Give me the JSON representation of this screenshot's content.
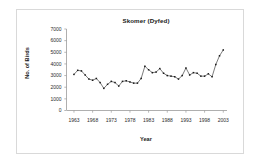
{
  "figure": {
    "background": "#ffffff",
    "border_color": "#d9d9d9"
  },
  "chart_data": {
    "type": "line",
    "title": "Skomer (Dyfed)",
    "xlabel": "Year",
    "ylabel": "No. of Birds",
    "grid": false,
    "legend": "none",
    "marker": "square",
    "line_color": "#333333",
    "marker_color": "#1a1a1a",
    "xlim": [
      1961,
      2004
    ],
    "ylim": [
      0,
      7000
    ],
    "ytick_labels": [
      "7000",
      "6000",
      "5000",
      "4000",
      "3000",
      "2000",
      "1000",
      "0"
    ],
    "ytick_values": [
      7000,
      6000,
      5000,
      4000,
      3000,
      2000,
      1000,
      0
    ],
    "xtick_labels": [
      "1963",
      "1968",
      "1973",
      "1978",
      "1983",
      "1988",
      "1993",
      "1998",
      "2003"
    ],
    "xtick_values": [
      1963,
      1968,
      1973,
      1978,
      1983,
      1988,
      1993,
      1998,
      2003
    ],
    "x": [
      1963,
      1964,
      1965,
      1966,
      1967,
      1968,
      1969,
      1970,
      1971,
      1972,
      1973,
      1974,
      1975,
      1976,
      1977,
      1978,
      1979,
      1980,
      1981,
      1982,
      1983,
      1984,
      1985,
      1986,
      1987,
      1988,
      1989,
      1990,
      1991,
      1992,
      1993,
      1994,
      1995,
      1996,
      1997,
      1998,
      1999,
      2000,
      2001,
      2002,
      2003
    ],
    "values": [
      3100,
      3450,
      3400,
      3050,
      2700,
      2600,
      2750,
      2400,
      1900,
      2250,
      2500,
      2400,
      2100,
      2500,
      2550,
      2450,
      2350,
      2350,
      2750,
      3800,
      3500,
      3250,
      3300,
      3600,
      3200,
      3000,
      2950,
      2900,
      2700,
      3000,
      3650,
      3050,
      3250,
      3200,
      2950,
      2950,
      3150,
      2900,
      3950,
      4700,
      5200
    ],
    "series_name": "No. of Birds"
  }
}
